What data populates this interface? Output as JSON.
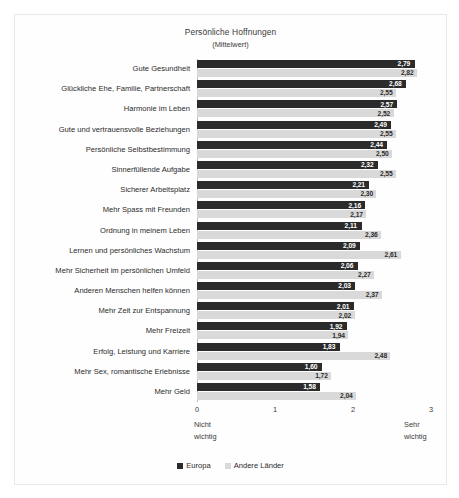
{
  "chart_data": {
    "type": "bar",
    "orientation": "horizontal",
    "title": "Persönliche Hoffnungen",
    "subtitle": "(Mittelwert)",
    "xlabel": "",
    "ylabel": "",
    "xlim": [
      0,
      3
    ],
    "xticks": [
      "0",
      "1",
      "2",
      "3"
    ],
    "grid": false,
    "legend_position": "bottom",
    "axis_caption_left": "Nicht\nwichtig",
    "axis_caption_left_line1": "Nicht",
    "axis_caption_left_line2": "wichtig",
    "axis_caption_right_line1": "Sehr",
    "axis_caption_right_line2": "wichtig",
    "categories": [
      "Gute Gesundheit",
      "Glückliche Ehe, Familie, Partnerschaft",
      "Harmonie im Leben",
      "Gute und vertrauensvolle Beziehungen",
      "Persönliche Selbstbestimmung",
      "Sinnerfüllende Aufgabe",
      "Sicherer Arbeitsplatz",
      "Mehr Spass mit Freunden",
      "Ordnung in meinem Leben",
      "Lernen und persönliches Wachstum",
      "Mehr Sicherheit im persönlichen Umfeld",
      "Anderen Menschen helfen können",
      "Mehr Zeit zur Entspannung",
      "Mehr Freizeit",
      "Erfolg, Leistung und Karriere",
      "Mehr Sex, romantische Erlebnisse",
      "Mehr Geld"
    ],
    "series": [
      {
        "name": "Europa",
        "color": "#2b2b2b",
        "values": [
          2.79,
          2.68,
          2.57,
          2.49,
          2.44,
          2.32,
          2.21,
          2.16,
          2.11,
          2.09,
          2.06,
          2.03,
          2.01,
          1.92,
          1.83,
          1.6,
          1.58
        ],
        "labels": [
          "2,79",
          "2,68",
          "2,57",
          "2,49",
          "2,44",
          "2,32",
          "2,21",
          "2,16",
          "2,11",
          "2,09",
          "2,06",
          "2,03",
          "2,01",
          "1,92",
          "1,83",
          "1,60",
          "1,58"
        ]
      },
      {
        "name": "Andere Länder",
        "color": "#d9d9d9",
        "values": [
          2.82,
          2.55,
          2.52,
          2.55,
          2.5,
          2.55,
          2.3,
          2.17,
          2.36,
          2.61,
          2.27,
          2.37,
          2.02,
          1.94,
          2.48,
          1.72,
          2.04
        ],
        "labels": [
          "2,82",
          "2,55",
          "2,52",
          "2,55",
          "2,50",
          "2,55",
          "2,30",
          "2,17",
          "2,36",
          "2,61",
          "2,27",
          "2,37",
          "2,02",
          "1,94",
          "2,48",
          "1,72",
          "2,04"
        ]
      }
    ]
  }
}
